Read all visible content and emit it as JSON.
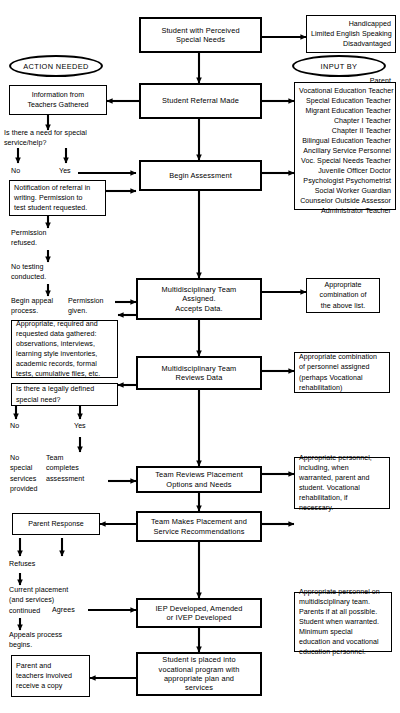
{
  "diagram": {
    "type": "flowchart",
    "stroke_color": "#000000",
    "background_color": "#ffffff"
  },
  "ovals": {
    "action_needed": "ACTION NEEDED",
    "input_by": "INPUT BY"
  },
  "process_boxes": {
    "student_with_needs": "Student with Perceived\nSpecial Needs",
    "student_referral": "Student Referral Made",
    "begin_assessment": "Begin Assessment",
    "team_assigned": "Multidisciplinary Team\nAssigned.\nAccepts Data.",
    "team_reviews_data": "Multidisciplinary Team\nReviews Data",
    "team_reviews_placement": "Team Reviews Placement\nOptions and Needs",
    "team_makes_placement": "Team Makes Placement and\nService Recommendations",
    "iep_developed": "IEP Developed, Amended\nor IVEP Developed",
    "student_placed": "Student is placed into\nvocational program with\nappropriate plan and\nservices"
  },
  "right_boxes": {
    "categories": [
      "Handicapped",
      "Limited English Speaking",
      "Disadvantaged"
    ],
    "input_by_list": [
      "Parent",
      "Vocational Education Teacher",
      "Special Education Teacher",
      "Migrant Education Teacher",
      "Chapter I Teacher",
      "Chapter II Teacher",
      "Bilingual Education Teacher",
      "Ancillary Service Personnel",
      "Voc. Special Needs Teacher",
      "Juvenile Officer      Doctor",
      "Psychologist    Psychometrist",
      "Social Worker        Guardian",
      "Counselor     Outside Assessor",
      "Administrator        Teacher"
    ],
    "appropriate_combination": "Appropriate\ncombination of\nthe above list.",
    "personnel_assigned": "Appropriate combination\nof personnel assigned\n(perhaps Vocational\nrehabilitation)",
    "appropriate_personnel": "Appropriate personnel,\nincluding, when\nwarranted, parent and\nstudent. Vocational\nrehabilitation, if\nnecessary.",
    "multidisciplinary_personnel": "Appropriate personnel on\nmultidisciplinary team.\nParents if at all possible.\nStudent when warranted.\nMinimum special\neducation and vocational\neducation personnel."
  },
  "left_boxes": {
    "information_gathered": "Information from\nTeachers Gathered",
    "notification": "Notification of referral in\nwriting. Permission to\ntest student requested.",
    "data_gathered": "Appropriate, required and\nrequested data gathered:\nobservations, interviews,\nlearning style inventories,\nacademic records, formal\ntests, cumulative files, etc.",
    "legally_defined": "Is there a legally defined\nspecial need?",
    "parent_response": "Parent Response",
    "parent_teachers_copy": "Parent and\nteachers involved\nreceive a copy"
  },
  "left_labels": {
    "need_question": "Is there a need for special\nservice/help?",
    "no_1": "No",
    "yes_1": "Yes",
    "permission_refused": "Permission\nrefused.",
    "no_testing": "No testing\nconducted.",
    "begin_appeal": "Begin appeal\nprocess.",
    "permission_given": "Permission\ngiven.",
    "no_2": "No",
    "yes_2": "Yes",
    "no_special_services": "No\nspecial\nservices\nprovided",
    "team_completes": "Team\ncompletes\nassessment",
    "refuses": "Refuses",
    "agrees": "Agrees",
    "current_placement": "Current placement\n(and services)\ncontinued",
    "appeals_process": "Appeals process\nbegins."
  }
}
